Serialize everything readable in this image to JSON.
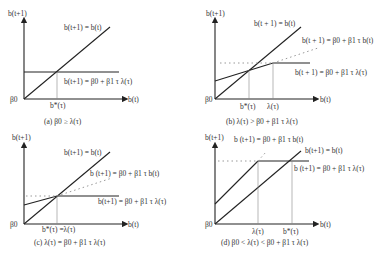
{
  "figure": {
    "panels": [
      {
        "id": "a",
        "y_axis_label": "b(t+1)",
        "x_axis_label": "b(t)",
        "origin_label": "β0",
        "line_labels": [
          "b(t+1) = b(t)",
          "b(t+1) = β0 + β1 τ λ(τ)"
        ],
        "x_ticks": [
          "b*(τ)"
        ],
        "caption": "(a)  β0 ≥ λ(τ)"
      },
      {
        "id": "b",
        "y_axis_label": "b(t+1)",
        "x_axis_label": "b(t)",
        "origin_label": "β0",
        "line_labels": [
          "b(t + 1) = b(t)",
          "b(t + 1) = β0 + β1 τ b(t)",
          "b(t + 1) = β0 + β1 τ λ(τ)"
        ],
        "x_ticks": [
          "b*(τ)",
          "λ(τ)"
        ],
        "caption": "(b)  λ(τ) > β0 + β1 τ λ(τ)"
      },
      {
        "id": "c",
        "y_axis_label": "b(t+1)",
        "x_axis_label": "b(t)",
        "origin_label": "β0",
        "line_labels": [
          "b(t+1) = b(t)",
          "b (t+1) = β0 + β1 τ b(t)",
          "b(t+1) = β0 + β1 τ λ(τ)"
        ],
        "x_ticks": [
          "b*(τ) =λ(τ)"
        ],
        "caption": "(c) λ(τ) = β0 + β1 τ λ(τ)"
      },
      {
        "id": "d",
        "y_axis_label": "b(t+1)",
        "x_axis_label": "b(t)",
        "origin_label": "β0",
        "line_labels": [
          "b (t+1) = β0 + β1 τ b(t)",
          "b(t+1) = b(t)",
          "b (t+1) = β0 + β1 τ λ(τ)"
        ],
        "x_ticks": [
          "λ(τ)",
          "b*(τ)"
        ],
        "caption": "(d)  β0 < λ(τ) < β0 + β1 τ λ(τ)"
      }
    ]
  }
}
